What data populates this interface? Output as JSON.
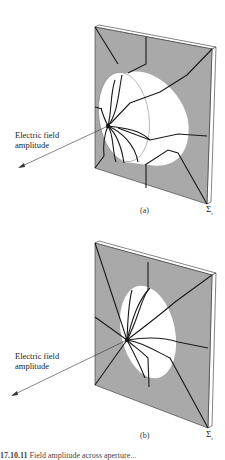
{
  "figure": {
    "panels": [
      {
        "id": "a",
        "sublabel": "(a)",
        "label_line1": "Electric field",
        "label_line2": "amplitude",
        "sigma": "Σ",
        "sigma_sub": "i",
        "aperture": "cylindrical-lens-surface"
      },
      {
        "id": "b",
        "sublabel": "(b)",
        "label_line1": "Electric field",
        "label_line2": "amplitude",
        "sigma": "Σ",
        "sigma_sub": "i",
        "aperture": "flat-elliptical-opening"
      }
    ],
    "caption_number": "17.10.11",
    "caption_text": "Field amplitude across aperture..."
  },
  "colors": {
    "frame_fill": "#a9a9a9",
    "line": "#1a1a1a",
    "aperture": "#ffffff"
  }
}
